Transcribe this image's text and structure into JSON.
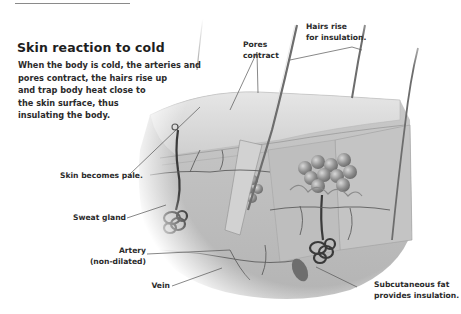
{
  "title": "Skin reaction to cold",
  "body_lines": [
    "When the body is cold, the arteries and",
    "pores contract, the hairs rise up",
    "and trap body heat close to",
    "the skin surface, thus",
    "insulating the body."
  ],
  "labels": {
    "pores": [
      "Pores",
      "contract"
    ],
    "hairs": [
      "Hairs rise",
      "for insulation."
    ],
    "pale": "Skin becomes pale.",
    "sweat": "Sweat gland",
    "artery": [
      "Artery",
      "(non-dilated)"
    ],
    "vein": "Vein",
    "fat": [
      "Subcutaneous fat",
      "provides insulation."
    ]
  }
}
